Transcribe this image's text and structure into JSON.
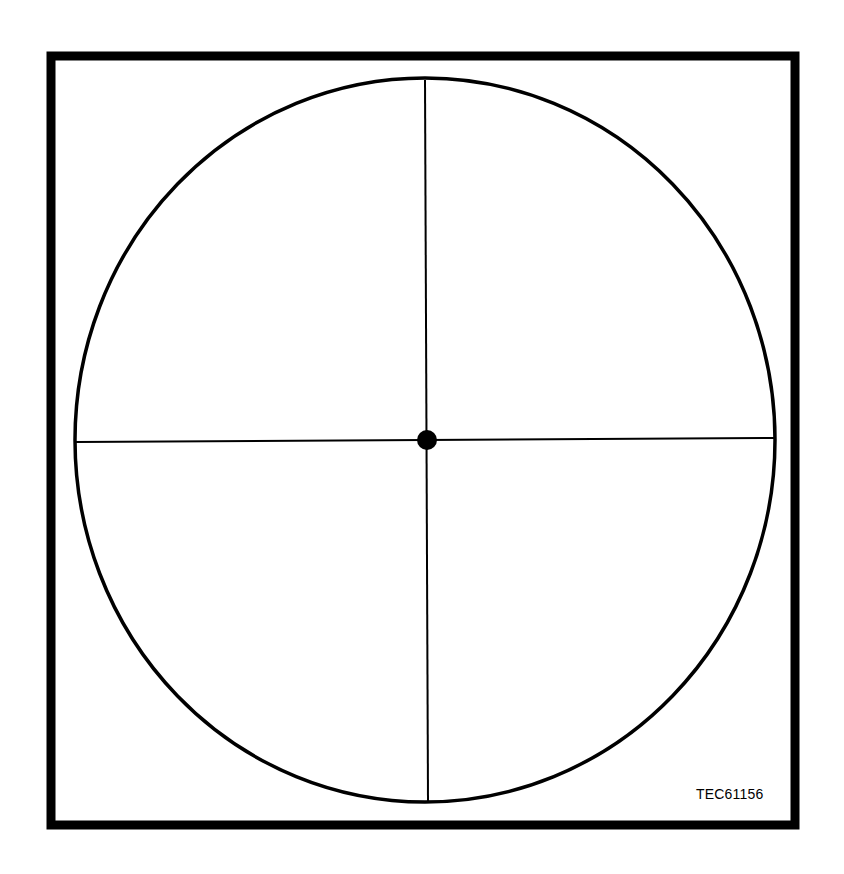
{
  "figure": {
    "reference_code": "TEC61156",
    "colors": {
      "background": "#ffffff",
      "stroke": "#000000"
    },
    "elements": {
      "frame": "square-border",
      "circle": "outer-circle",
      "crosshair": [
        "vertical-line",
        "horizontal-line"
      ],
      "center": "center-dot"
    }
  }
}
